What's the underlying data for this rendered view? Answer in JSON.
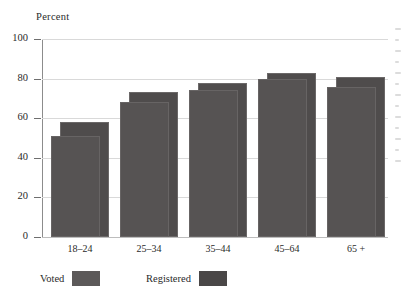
{
  "chart_data": {
    "type": "bar",
    "title": "",
    "subtitle": "",
    "xlabel": "",
    "ylabel": "Percent",
    "ylim": [
      0,
      100
    ],
    "yticks": [
      0,
      20,
      40,
      60,
      80,
      100
    ],
    "ytick_labels": [
      "0",
      "20",
      "40",
      "60",
      "80",
      "100"
    ],
    "grid": true,
    "legend_position": "below-axis-left",
    "categories": [
      "18–24",
      "25–34",
      "35–44",
      "45–64",
      "65 +"
    ],
    "series": [
      {
        "name": "Voted",
        "values": [
          51,
          68,
          74,
          80,
          76
        ]
      },
      {
        "name": "Registered",
        "values": [
          58,
          73,
          78,
          83,
          81
        ]
      }
    ],
    "annotations": []
  },
  "axis": {
    "y_title": "Percent"
  },
  "legend": {
    "items": [
      {
        "label": "Voted",
        "swatch_color": "#5c5959"
      },
      {
        "label": "Registered",
        "swatch_color": "#4a4747"
      }
    ]
  },
  "colors": {
    "bar_voted": "#565353",
    "bar_registered": "#4f4c4c",
    "gridline": "#d9d9d9",
    "axis": "#8c8c8c",
    "text": "#2a2a2a",
    "background": "#ffffff"
  }
}
